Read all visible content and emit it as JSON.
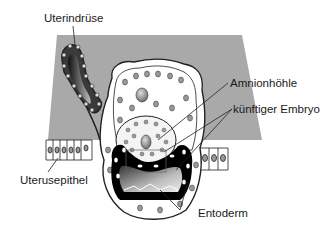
{
  "labels": {
    "uterindruse": "Uterindrüse",
    "amnionhohle": "Amnionhöhle",
    "kunftiger_embryo": "künftiger Embryo",
    "uterusepithel": "Uterusepithel",
    "entoderm": "Entoderm"
  },
  "colors": {
    "background_gray": "#a9a9a9",
    "cell_fill": "#ffffff",
    "nucleus_fill": "#9a9a9a",
    "dark_layer": "#000000",
    "line": "#222222"
  }
}
